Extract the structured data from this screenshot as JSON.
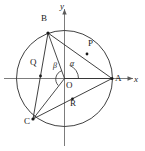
{
  "figure": {
    "type": "geometry-diagram",
    "axes": {
      "x_label": "x",
      "y_label": "y",
      "origin_label": "O"
    },
    "points": [
      {
        "label": "A",
        "x": 112,
        "y": 78.5,
        "label_x": 115,
        "label_y": 80,
        "on_circle": true
      },
      {
        "label": "B",
        "x": 48,
        "y": 33,
        "label_x": 41,
        "label_y": 19,
        "on_circle": true
      },
      {
        "label": "C",
        "x": 33,
        "y": 119,
        "label_x": 24,
        "label_y": 122,
        "on_circle": true
      },
      {
        "label": "P",
        "x": 87,
        "y": 54,
        "label_x": 88,
        "label_y": 44,
        "on_circle": false
      },
      {
        "label": "Q",
        "x": 40.5,
        "y": 76,
        "label_x": 30,
        "label_y": 63,
        "on_circle": false
      },
      {
        "label": "R",
        "x": 72.5,
        "y": 98.8,
        "label_x": 70,
        "label_y": 103,
        "on_circle": false
      }
    ],
    "angles": [
      {
        "label": "α",
        "label_x": 70,
        "label_y": 65,
        "between": "positive x-axis and OB"
      },
      {
        "label": "β",
        "label_x": 54,
        "label_y": 66,
        "between": "OB and OC"
      }
    ],
    "circle": {
      "center_x": 64.5,
      "center_y": 78.5,
      "radius": 48
    },
    "segments": [
      "B-A",
      "B-C",
      "C-A",
      "O-B",
      "O-C",
      "O-A"
    ],
    "colors": {
      "stroke": "#2b2b2b",
      "axis": "#555555",
      "background": "#ffffff",
      "label": "#1a1a1a"
    }
  }
}
